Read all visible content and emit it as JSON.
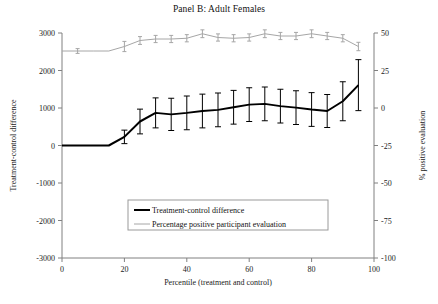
{
  "chart_data": {
    "type": "line",
    "title": "Panel B: Adult Females",
    "xlabel": "Percentile (treatment and control)",
    "ylabel": "Treatment-control difference",
    "y2label": "% positive evaluation",
    "xlim": [
      0,
      100
    ],
    "ylim": [
      -3000,
      3000
    ],
    "y2lim": [
      -100,
      50
    ],
    "xticks": [
      0,
      20,
      40,
      60,
      80,
      100
    ],
    "yticks": [
      -3000,
      -2000,
      -1000,
      0,
      1000,
      2000,
      3000
    ],
    "y2ticks": [
      -100,
      -75,
      -50,
      -25,
      0,
      25,
      50
    ],
    "grid": false,
    "legend_position": "lower-center",
    "x": [
      0,
      5,
      10,
      15,
      20,
      25,
      30,
      35,
      40,
      45,
      50,
      55,
      60,
      65,
      70,
      75,
      80,
      85,
      90,
      95
    ],
    "series": [
      {
        "name": "Treatment-control difference",
        "color": "#000000",
        "axis": "left",
        "width": 2.0,
        "values": [
          0,
          0,
          0,
          0,
          230,
          640,
          870,
          830,
          870,
          920,
          950,
          1020,
          1090,
          1110,
          1050,
          1010,
          960,
          920,
          1180,
          1610
        ],
        "errors": [
          0,
          0,
          0,
          0,
          180,
          330,
          400,
          430,
          450,
          450,
          450,
          450,
          450,
          450,
          450,
          450,
          450,
          440,
          520,
          680
        ]
      },
      {
        "name": "Percentage positive participant evaluation",
        "color": "#a6a6a6",
        "axis": "right",
        "width": 1.0,
        "values": [
          38.0,
          38.0,
          38.0,
          38.0,
          41.0,
          45.0,
          46.0,
          46.0,
          46.5,
          49.5,
          47.0,
          46.5,
          47.0,
          49.5,
          48.0,
          48.0,
          49.5,
          48.0,
          46.5,
          41.0
        ],
        "errors": [
          0,
          1.6,
          0,
          0,
          3.4,
          2.6,
          2.4,
          2.4,
          2.4,
          2.6,
          2.4,
          2.4,
          2.4,
          2.6,
          2.4,
          2.4,
          2.6,
          2.4,
          2.4,
          2.8
        ]
      }
    ],
    "legend": [
      {
        "label": "Treatment-control difference",
        "color": "#000000",
        "width": 2.0
      },
      {
        "label": "Percentage positive participant evaluation",
        "color": "#a6a6a6",
        "width": 1.0
      }
    ],
    "tick_labels": {
      "y": [
        "3000",
        "2000",
        "1000",
        "0",
        "-1000",
        "-2000",
        "-3000"
      ],
      "y2": [
        "50",
        "25",
        "0",
        "-25",
        "-50",
        "-75",
        "-100"
      ],
      "x": [
        "0",
        "20",
        "40",
        "60",
        "80",
        "100"
      ]
    }
  }
}
